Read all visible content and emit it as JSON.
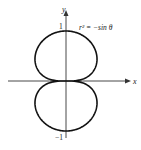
{
  "chart_data": {
    "type": "line",
    "title": "",
    "equation": "r² = −sin θ",
    "xlabel": "x",
    "ylabel": "y",
    "y_ticks": [
      {
        "value": 1,
        "label": "1"
      },
      {
        "value": -1,
        "label": "−1"
      }
    ],
    "xlim": [
      -1.2,
      1.3
    ],
    "ylim": [
      -1.1,
      1.4
    ],
    "grid": false,
    "legend": null,
    "series": [
      {
        "name": "r² = −sin θ (lemniscate-like curve, two loops)",
        "polar": true,
        "r_squared": "-sin(theta)",
        "extent_y": [
          -1,
          1
        ],
        "extent_x_approx": [
          -0.62,
          0.62
        ]
      }
    ]
  },
  "labels": {
    "equation": "r² = −sin θ",
    "x_axis": "x",
    "y_axis": "y",
    "tick_pos": "1",
    "tick_neg": "−1"
  }
}
